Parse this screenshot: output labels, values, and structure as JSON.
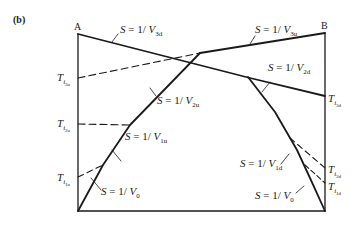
{
  "figure": {
    "panel_label": "(b)",
    "points": {
      "A": "A",
      "B": "B"
    },
    "lines": {
      "v3d": {
        "S": "S",
        "eq": " = 1/ ",
        "V": "V",
        "sub": "3d"
      },
      "v3u": {
        "S": "S",
        "eq": " = 1/ ",
        "V": "V",
        "sub": "3u"
      },
      "v2d": {
        "S": "S",
        "eq": " = 1/ ",
        "V": "V",
        "sub": "2d"
      },
      "v2u": {
        "S": "S",
        "eq": " = 1/ ",
        "V": "V",
        "sub": "2u"
      },
      "v1u": {
        "S": "S",
        "eq": " = 1/ ",
        "V": "V",
        "sub": "1u"
      },
      "v1d": {
        "S": "S",
        "eq": " = 1/ ",
        "V": "V",
        "sub": "1d"
      },
      "v0_left": {
        "S": "S",
        "eq": " = 1/ ",
        "V": "V",
        "sub": "0"
      },
      "v0_right": {
        "S": "S",
        "eq": " = 1/ ",
        "V": "V",
        "sub": "0"
      }
    },
    "intercepts": {
      "ti3u": {
        "T": "T",
        "i": "i",
        "sub": "3u"
      },
      "ti2u": {
        "T": "T",
        "i": "i",
        "sub": "2u"
      },
      "ti1u": {
        "T": "T",
        "i": "i",
        "sub": "1u"
      },
      "ti3d": {
        "T": "T",
        "i": "i",
        "sub": "3d"
      },
      "ti2d": {
        "T": "T",
        "i": "i",
        "sub": "2d"
      },
      "ti1d": {
        "T": "T",
        "i": "i",
        "sub": "1d"
      }
    },
    "colors": {
      "ink": "#1a1a1a",
      "background": "#ffffff"
    }
  }
}
